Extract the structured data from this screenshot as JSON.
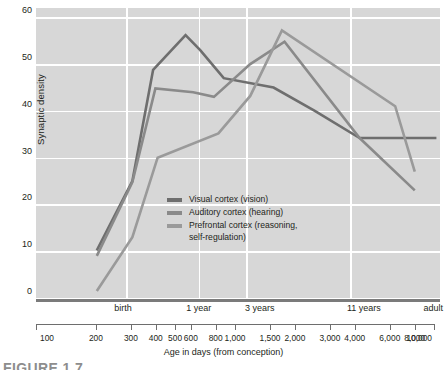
{
  "chart_data": {
    "type": "line",
    "title": "",
    "xlabel": "Age in days (from conception)",
    "ylabel": "Synaptic density",
    "xscale": "log",
    "xlim": [
      100,
      10000
    ],
    "ylim": [
      0,
      62
    ],
    "grid": true,
    "legend_position": "inside-center-left",
    "y_ticks": [
      0,
      10,
      20,
      30,
      40,
      50,
      60
    ],
    "x_ticks": [
      100,
      200,
      300,
      400,
      500,
      600,
      800,
      1000,
      1500,
      2000,
      3000,
      4000,
      6000,
      8000,
      10000
    ],
    "x_tick_labels": [
      "100",
      "200",
      "300",
      "400",
      "500",
      "600",
      "800",
      "1,000",
      "1,500",
      "2,000",
      "3,000",
      "4,000",
      "6,000",
      "8,000",
      "10,000"
    ],
    "milestones": [
      {
        "label": "birth",
        "x": 270
      },
      {
        "label": "1 year",
        "x": 640
      },
      {
        "label": "3 years",
        "x": 1280
      },
      {
        "label": "11 years",
        "x": 4200
      },
      {
        "label": "adult",
        "x": 9600
      }
    ],
    "gridlines_x": [
      280,
      640,
      1100,
      3600
    ],
    "series": [
      {
        "name": "Visual cortex (vision)",
        "color": "#6e6e6e",
        "points": [
          [
            200,
            10.2
          ],
          [
            300,
            25.0
          ],
          [
            380,
            48.8
          ],
          [
            550,
            56.2
          ],
          [
            650,
            53.0
          ],
          [
            850,
            47.0
          ],
          [
            1500,
            45.0
          ],
          [
            2400,
            40.0
          ],
          [
            4000,
            34.2
          ],
          [
            9600,
            34.2
          ]
        ]
      },
      {
        "name": "Auditory cortex (hearing)",
        "color": "#8a8a8a",
        "points": [
          [
            200,
            9.0
          ],
          [
            300,
            24.8
          ],
          [
            390,
            44.8
          ],
          [
            600,
            44.0
          ],
          [
            760,
            43.0
          ],
          [
            1150,
            50.0
          ],
          [
            1700,
            54.8
          ],
          [
            4000,
            34.2
          ],
          [
            7500,
            23.0
          ]
        ]
      },
      {
        "name": "Prefrontal cortex (reasoning, self-regulation)",
        "color": "#9a9a9a",
        "points": [
          [
            200,
            1.5
          ],
          [
            300,
            13.0
          ],
          [
            400,
            30.0
          ],
          [
            800,
            35.2
          ],
          [
            1150,
            43.2
          ],
          [
            1650,
            57.2
          ],
          [
            6000,
            41.0
          ],
          [
            7500,
            27.0
          ]
        ]
      }
    ],
    "legend_entries": [
      {
        "label": "Visual cortex (vision)",
        "color": "#6e6e6e"
      },
      {
        "label": "Auditory cortex (hearing)",
        "color": "#8a8a8a"
      },
      {
        "label": "Prefrontal cortex (reasoning,",
        "label2": "self-regulation)",
        "color": "#9a9a9a"
      }
    ]
  },
  "figure": {
    "caption": "FIGURE 1.7"
  }
}
